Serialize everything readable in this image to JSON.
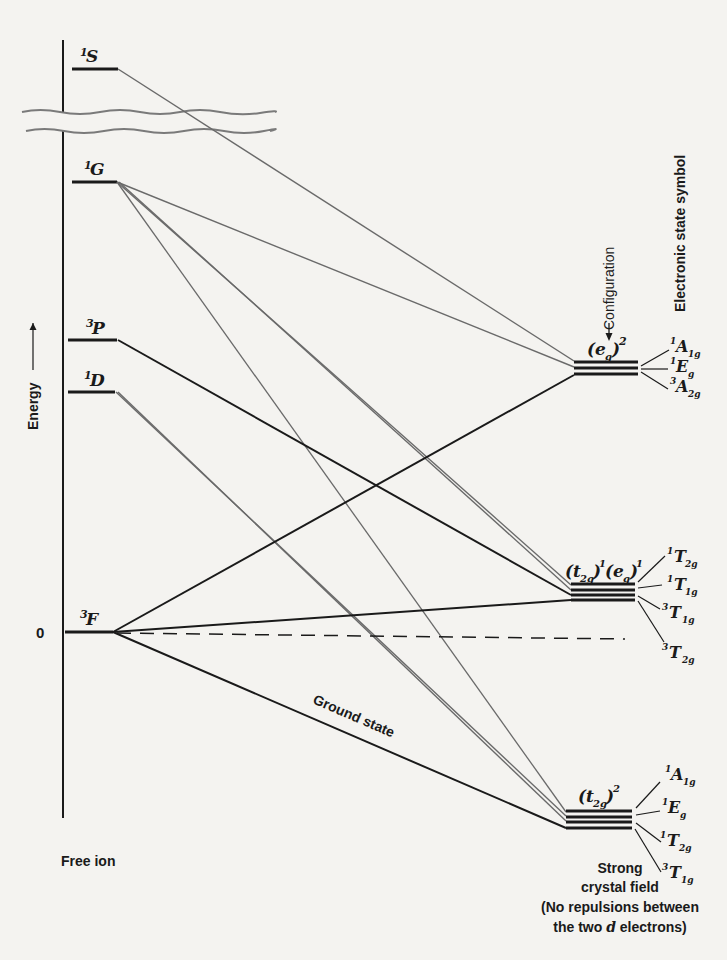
{
  "diagram": {
    "type": "correlation-diagram",
    "axis": {
      "label": "Energy",
      "arrow": "→",
      "zero_label": "0"
    },
    "free_ion": {
      "label": "Free ion",
      "terms": [
        {
          "id": "1S",
          "mult": "1",
          "letter": "S",
          "y": 69
        },
        {
          "id": "1G",
          "mult": "1",
          "letter": "G",
          "y": 182
        },
        {
          "id": "3P",
          "mult": "3",
          "letter": "P",
          "y": 340
        },
        {
          "id": "1D",
          "mult": "1",
          "letter": "D",
          "y": 392
        },
        {
          "id": "3F",
          "mult": "3",
          "letter": "F",
          "y": 632
        }
      ]
    },
    "ground_state_label": "Ground state",
    "configuration_label": "Configuration",
    "electronic_state_label": "Electronic state symbol",
    "strong_field": {
      "label_line1": "Strong",
      "label_line2": "crystal field",
      "label_line3": "(No repulsions between",
      "label_line4_a": "the two ",
      "label_line4_d": "d",
      "label_line4_b": " electrons)",
      "configurations": [
        {
          "id": "eg2",
          "config": "(e_g)^2",
          "states": [
            {
              "mult": "1",
              "sym": "A",
              "sub": "1g"
            },
            {
              "mult": "1",
              "sym": "E",
              "sub": "g"
            },
            {
              "mult": "3",
              "sym": "A",
              "sub": "2g"
            }
          ]
        },
        {
          "id": "t2g1eg1",
          "config": "(t_2g)^1(e_g)^1",
          "states": [
            {
              "mult": "1",
              "sym": "T",
              "sub": "2g"
            },
            {
              "mult": "1",
              "sym": "T",
              "sub": "1g"
            },
            {
              "mult": "3",
              "sym": "T",
              "sub": "1g"
            },
            {
              "mult": "3",
              "sym": "T",
              "sub": "2g"
            }
          ]
        },
        {
          "id": "t2g2",
          "config": "(t_2g)^2",
          "states": [
            {
              "mult": "1",
              "sym": "A",
              "sub": "1g"
            },
            {
              "mult": "1",
              "sym": "E",
              "sub": "g"
            },
            {
              "mult": "1",
              "sym": "T",
              "sub": "2g"
            },
            {
              "mult": "3",
              "sym": "T",
              "sub": "1g"
            }
          ]
        }
      ]
    },
    "correlations": [
      {
        "from": "1S",
        "to": "eg2:1A1g"
      },
      {
        "from": "1G",
        "to": "eg2:1Eg"
      },
      {
        "from": "1G",
        "to": "t2g1eg1:1T2g"
      },
      {
        "from": "1G",
        "to": "t2g1eg1:1T1g"
      },
      {
        "from": "1G",
        "to": "t2g2:1Eg"
      },
      {
        "from": "1G",
        "to": "t2g2:1T2g"
      },
      {
        "from": "3P",
        "to": "t2g1eg1:3T1g"
      },
      {
        "from": "1D",
        "to": "t2g2:1A1g"
      },
      {
        "from": "1D",
        "to": "t2g1eg1:1T2g"
      },
      {
        "from": "3F",
        "to": "eg2:3A2g"
      },
      {
        "from": "3F",
        "to": "t2g1eg1:3T2g"
      },
      {
        "from": "3F",
        "to": "t2g2:3T1g"
      }
    ],
    "colors": {
      "ink": "#1a1a1a",
      "grey_line": "#6a6a6a",
      "paper": "#f4f3f0"
    }
  }
}
